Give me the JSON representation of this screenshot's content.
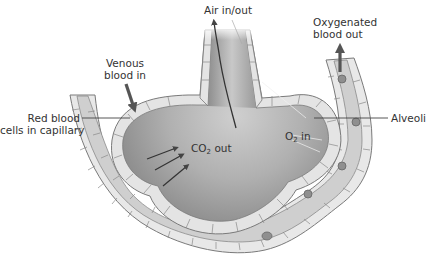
{
  "diagram": {
    "type": "alveolus-gas-exchange",
    "colors": {
      "background": "#ffffff",
      "alveolus_fill": "#9a9a9a",
      "alveolus_highlight": "#c4c4c4",
      "cell_wall_fill": "#e6e6e6",
      "cell_wall_stroke": "#7a7a7a",
      "capillary_fill": "#d6d6d6",
      "red_blood_cell": "#8a8a8a",
      "arrow": "#444444",
      "label_text": "#333333",
      "leader_line": "#444444"
    },
    "labels": {
      "air": "Air in/out",
      "venous_line1": "Venous",
      "venous_line2": "blood in",
      "oxygenated_line1": "Oxygenated",
      "oxygenated_line2": "blood out",
      "red_blood_line1": "Red blood",
      "red_blood_line2": "cells in capillary",
      "alveoli": "Alveoli",
      "co2_main": "CO",
      "co2_sub": "2",
      "co2_suffix": " out",
      "o2_main": "O",
      "o2_sub": "2",
      "o2_suffix": " in"
    },
    "arrows": [
      {
        "name": "air-flow-arrow",
        "direction": "up"
      },
      {
        "name": "venous-inflow-arrow",
        "direction": "down"
      },
      {
        "name": "oxygenated-outflow-arrow",
        "direction": "up"
      },
      {
        "name": "co2-diffusion-arrow",
        "count": 3,
        "direction": "into-alveolus"
      }
    ]
  }
}
